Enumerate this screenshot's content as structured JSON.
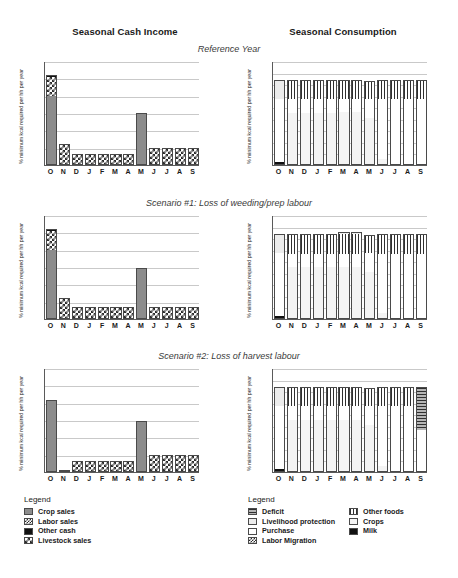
{
  "headers": {
    "left_column_title": "Seasonal Cash Income",
    "right_column_title": "Seasonal Consumption"
  },
  "panels": [
    {
      "subtitle": "Reference Year"
    },
    {
      "subtitle": "Scenario #1: Loss of weeding/prep labour"
    },
    {
      "subtitle": "Scenario #2: Loss of harvest labour"
    }
  ],
  "axis": {
    "ylabel": "% minimum kcal required per hh per year",
    "left_yticks": [
      "0",
      "50",
      "100",
      "150",
      "200",
      "250",
      "300"
    ],
    "right_yticks": [
      "0",
      "20",
      "40",
      "60",
      "80",
      "100",
      "120",
      "140",
      "160",
      "180"
    ],
    "months": [
      "O",
      "N",
      "D",
      "J",
      "F",
      "M",
      "A",
      "M",
      "J",
      "J",
      "A",
      "S"
    ]
  },
  "legends": {
    "income": {
      "title": "Legend",
      "items": [
        {
          "label": "Crop sales",
          "icon": "swatch-solid-gray",
          "fill": "f-gray"
        },
        {
          "label": "Labor sales",
          "icon": "swatch-checker-fine",
          "fill": "f-checksm"
        },
        {
          "label": "Other cash",
          "icon": "swatch-solid-black",
          "fill": "f-black"
        },
        {
          "label": "Livestock sales",
          "icon": "swatch-checker",
          "fill": "f-check"
        }
      ]
    },
    "consumption": {
      "title": "Legend",
      "column1": [
        {
          "label": "Deficit",
          "icon": "swatch-horizontal-lines",
          "fill": "f-hlines"
        },
        {
          "label": "Livelihood protection",
          "icon": "swatch-light-gray",
          "fill": "f-ltgray"
        },
        {
          "label": "Purchase",
          "icon": "swatch-white",
          "fill": "f-white"
        },
        {
          "label": "Labor Migration",
          "icon": "swatch-checker-fine",
          "fill": "f-checksm"
        }
      ],
      "column2": [
        {
          "label": "Other foods",
          "icon": "swatch-vertical-lines",
          "fill": "f-vlines"
        },
        {
          "label": "Crops",
          "icon": "swatch-very-light-gray",
          "fill": "f-vltgray"
        },
        {
          "label": "Milk",
          "icon": "swatch-solid-black",
          "fill": "f-black"
        }
      ]
    }
  },
  "chart_data": [
    {
      "id": "income-reference",
      "type": "bar",
      "stacked": true,
      "title": "Seasonal Cash Income",
      "subtitle": "Reference Year",
      "xlabel": "",
      "ylabel": "% minimum kcal required per hh per year",
      "ylim": [
        0,
        300
      ],
      "grid": true,
      "legend_position": "below",
      "categories": [
        "O",
        "N",
        "D",
        "J",
        "F",
        "M",
        "A",
        "M",
        "J",
        "J",
        "A",
        "S"
      ],
      "series": [
        {
          "name": "Crop sales",
          "fill": "f-gray",
          "values": [
            200,
            0,
            0,
            0,
            0,
            0,
            0,
            147,
            0,
            0,
            0,
            0
          ]
        },
        {
          "name": "Labor sales",
          "fill": "f-checksm",
          "values": [
            0,
            0,
            0,
            0,
            0,
            0,
            0,
            0,
            0,
            0,
            0,
            0
          ]
        },
        {
          "name": "Livestock sales",
          "fill": "f-check",
          "values": [
            55,
            58,
            33,
            33,
            33,
            33,
            33,
            0,
            50,
            50,
            50,
            50
          ]
        },
        {
          "name": "Other cash",
          "fill": "f-black",
          "values": [
            5,
            2,
            0,
            0,
            0,
            0,
            0,
            3,
            0,
            0,
            0,
            0
          ]
        }
      ],
      "totals": [
        260,
        60,
        33,
        33,
        33,
        33,
        33,
        150,
        50,
        50,
        50,
        50
      ]
    },
    {
      "id": "consumption-reference",
      "type": "bar",
      "stacked": true,
      "title": "Seasonal Consumption",
      "subtitle": "Reference Year",
      "xlabel": "",
      "ylabel": "% minimum kcal required per hh per year",
      "ylim": [
        0,
        180
      ],
      "grid": true,
      "legend_position": "below",
      "categories": [
        "O",
        "N",
        "D",
        "J",
        "F",
        "M",
        "A",
        "M",
        "J",
        "J",
        "A",
        "S"
      ],
      "series": [
        {
          "name": "Milk",
          "fill": "f-black",
          "values": [
            5,
            0,
            0,
            0,
            0,
            0,
            0,
            0,
            0,
            0,
            0,
            0
          ]
        },
        {
          "name": "Crops",
          "fill": "f-vltgray",
          "values": [
            0,
            90,
            90,
            90,
            90,
            91,
            91,
            81,
            11,
            0,
            0,
            0
          ]
        },
        {
          "name": "Purchase",
          "fill": "f-white",
          "values": [
            110,
            25,
            25,
            25,
            25,
            24,
            24,
            34,
            104,
            115,
            115,
            115
          ]
        },
        {
          "name": "Other foods",
          "fill": "f-vlines",
          "values": [
            0,
            33,
            33,
            33,
            33,
            33,
            33,
            30,
            33,
            33,
            33,
            33
          ]
        },
        {
          "name": "Livelihood protection",
          "fill": "f-ltgray",
          "values": [
            33,
            0,
            0,
            0,
            0,
            0,
            0,
            0,
            0,
            0,
            0,
            0
          ]
        }
      ],
      "totals": [
        148,
        148,
        148,
        148,
        148,
        148,
        148,
        145,
        148,
        148,
        148,
        148
      ]
    },
    {
      "id": "income-scenario1",
      "type": "bar",
      "stacked": true,
      "title": "Seasonal Cash Income",
      "subtitle": "Scenario #1: Loss of weeding/prep labour",
      "xlabel": "",
      "ylabel": "% minimum kcal required per hh per year",
      "ylim": [
        0,
        300
      ],
      "grid": true,
      "categories": [
        "O",
        "N",
        "D",
        "J",
        "F",
        "M",
        "A",
        "M",
        "J",
        "J",
        "A",
        "S"
      ],
      "series": [
        {
          "name": "Crop sales",
          "fill": "f-gray",
          "values": [
            200,
            0,
            0,
            0,
            0,
            0,
            0,
            145,
            0,
            0,
            0,
            0
          ]
        },
        {
          "name": "Livestock sales",
          "fill": "f-check",
          "values": [
            55,
            58,
            31,
            31,
            31,
            31,
            31,
            0,
            31,
            31,
            31,
            31
          ]
        },
        {
          "name": "Other cash",
          "fill": "f-black",
          "values": [
            5,
            2,
            2,
            2,
            2,
            2,
            2,
            3,
            2,
            2,
            2,
            2
          ]
        }
      ],
      "totals": [
        260,
        60,
        33,
        33,
        33,
        33,
        33,
        148,
        33,
        33,
        33,
        33
      ]
    },
    {
      "id": "consumption-scenario1",
      "type": "bar",
      "stacked": true,
      "title": "Seasonal Consumption",
      "subtitle": "Scenario #1: Loss of weeding/prep labour",
      "xlabel": "",
      "ylabel": "% minimum kcal required per hh per year",
      "ylim": [
        0,
        180
      ],
      "grid": true,
      "categories": [
        "O",
        "N",
        "D",
        "J",
        "F",
        "M",
        "A",
        "M",
        "J",
        "J",
        "A",
        "S"
      ],
      "series": [
        {
          "name": "Milk",
          "fill": "f-black",
          "values": [
            5,
            0,
            0,
            0,
            0,
            0,
            0,
            0,
            0,
            0,
            0,
            0
          ]
        },
        {
          "name": "Crops",
          "fill": "f-vltgray",
          "values": [
            0,
            90,
            90,
            90,
            90,
            90,
            90,
            81,
            11,
            0,
            0,
            0
          ]
        },
        {
          "name": "Purchase",
          "fill": "f-white",
          "values": [
            110,
            23,
            23,
            23,
            23,
            23,
            23,
            33,
            102,
            113,
            113,
            113
          ]
        },
        {
          "name": "Other foods",
          "fill": "f-vlines",
          "values": [
            0,
            33,
            33,
            33,
            33,
            35,
            35,
            31,
            33,
            33,
            33,
            33
          ]
        },
        {
          "name": "Livelihood protection",
          "fill": "f-ltgray",
          "values": [
            33,
            2,
            2,
            2,
            2,
            2,
            2,
            0,
            2,
            2,
            2,
            2
          ]
        }
      ],
      "totals": [
        148,
        148,
        148,
        148,
        148,
        150,
        150,
        145,
        148,
        148,
        148,
        148
      ]
    },
    {
      "id": "income-scenario2",
      "type": "bar",
      "stacked": true,
      "title": "Seasonal Cash Income",
      "subtitle": "Scenario #2: Loss of harvest labour",
      "xlabel": "",
      "ylabel": "% minimum kcal required per hh per year",
      "ylim": [
        0,
        300
      ],
      "grid": true,
      "categories": [
        "O",
        "N",
        "D",
        "J",
        "F",
        "M",
        "A",
        "M",
        "J",
        "J",
        "A",
        "S"
      ],
      "series": [
        {
          "name": "Crop sales",
          "fill": "f-gray",
          "values": [
            205,
            0,
            0,
            0,
            0,
            0,
            0,
            143,
            0,
            0,
            0,
            0
          ]
        },
        {
          "name": "Livestock sales",
          "fill": "f-check",
          "values": [
            0,
            2,
            33,
            33,
            33,
            33,
            33,
            0,
            50,
            50,
            50,
            50
          ]
        },
        {
          "name": "Other cash",
          "fill": "f-black",
          "values": [
            3,
            0,
            0,
            0,
            0,
            0,
            0,
            4,
            0,
            0,
            0,
            0
          ]
        }
      ],
      "totals": [
        208,
        2,
        33,
        33,
        33,
        33,
        33,
        147,
        50,
        50,
        50,
        50
      ]
    },
    {
      "id": "consumption-scenario2",
      "type": "bar",
      "stacked": true,
      "title": "Seasonal Consumption",
      "subtitle": "Scenario #2: Loss of harvest labour",
      "xlabel": "",
      "ylabel": "% minimum kcal required per hh per year",
      "ylim": [
        0,
        180
      ],
      "grid": true,
      "categories": [
        "O",
        "N",
        "D",
        "J",
        "F",
        "M",
        "A",
        "M",
        "J",
        "J",
        "A",
        "S"
      ],
      "series": [
        {
          "name": "Milk",
          "fill": "f-black",
          "values": [
            5,
            0,
            0,
            0,
            0,
            0,
            0,
            0,
            0,
            0,
            0,
            0
          ]
        },
        {
          "name": "Crops",
          "fill": "f-vltgray",
          "values": [
            0,
            90,
            90,
            90,
            90,
            90,
            90,
            81,
            11,
            0,
            0,
            0
          ]
        },
        {
          "name": "Purchase",
          "fill": "f-white",
          "values": [
            110,
            25,
            25,
            25,
            25,
            25,
            25,
            34,
            104,
            115,
            115,
            72
          ]
        },
        {
          "name": "Other foods",
          "fill": "f-vlines",
          "values": [
            0,
            33,
            33,
            33,
            33,
            33,
            33,
            30,
            33,
            33,
            33,
            0
          ]
        },
        {
          "name": "Livelihood protection",
          "fill": "f-ltgray",
          "values": [
            33,
            0,
            0,
            0,
            0,
            0,
            0,
            0,
            0,
            0,
            0,
            0
          ]
        },
        {
          "name": "Deficit",
          "fill": "f-hlines",
          "values": [
            0,
            0,
            0,
            0,
            0,
            0,
            0,
            0,
            0,
            0,
            0,
            76
          ]
        }
      ],
      "totals": [
        148,
        148,
        148,
        148,
        148,
        148,
        148,
        145,
        148,
        148,
        148,
        148
      ]
    }
  ]
}
